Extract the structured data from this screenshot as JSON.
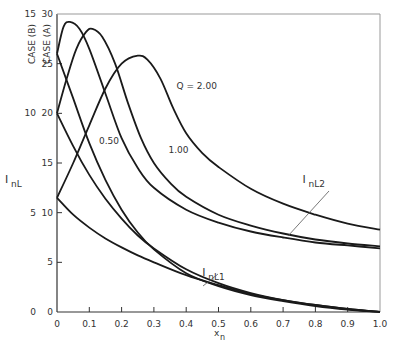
{
  "chart_data": {
    "type": "line",
    "title": "",
    "xlabel": "x_n",
    "ylabel": "I_nL",
    "xlim": [
      0,
      1.0
    ],
    "ylim": [
      0,
      30
    ],
    "grid": false,
    "x_ticks": [
      "0",
      "0.1",
      "0.2",
      "0.3",
      "0.4",
      "0.5",
      "0.6",
      "0.7",
      "0.8",
      "0.9",
      "1.0"
    ],
    "y_axes": [
      {
        "name": "CASE (B)",
        "ticks": [
          "0",
          "5",
          "10",
          "15"
        ],
        "range": [
          0,
          15
        ]
      },
      {
        "name": "CASE (A)",
        "ticks": [
          "0",
          "5",
          "10",
          "15",
          "20",
          "25",
          "30"
        ],
        "range": [
          0,
          30
        ]
      }
    ],
    "curve_labels": [
      {
        "text": "Q = 2.00",
        "x": 0.37,
        "y": 22.4
      },
      {
        "text": "1.00",
        "x": 0.345,
        "y": 16.0
      },
      {
        "text": "0.50",
        "x": 0.13,
        "y": 16.9
      }
    ],
    "group_labels": [
      {
        "main": "I",
        "sub": "nL2",
        "x": 0.76,
        "y": 13.0
      },
      {
        "main": "I",
        "sub": "nL1",
        "x": 0.45,
        "y": 3.6
      }
    ],
    "series": [
      {
        "name": "I_nL2, Q = 0.50",
        "group": "I_nL2",
        "x": [
          0,
          0.02,
          0.04,
          0.07,
          0.1,
          0.15,
          0.2,
          0.25,
          0.3,
          0.4,
          0.5,
          0.6,
          0.7,
          0.8,
          0.9,
          1.0
        ],
        "y": [
          26.0,
          28.7,
          29.2,
          28.5,
          26.5,
          22.0,
          17.5,
          14.5,
          12.5,
          10.3,
          9.0,
          8.1,
          7.5,
          7.0,
          6.7,
          6.4
        ]
      },
      {
        "name": "I_nL2, Q = 1.00",
        "group": "I_nL2",
        "x": [
          0,
          0.03,
          0.06,
          0.09,
          0.11,
          0.14,
          0.18,
          0.22,
          0.26,
          0.3,
          0.35,
          0.4,
          0.5,
          0.6,
          0.7,
          0.8,
          0.9,
          1.0
        ],
        "y": [
          20.0,
          23.5,
          26.5,
          28.2,
          28.5,
          27.7,
          25.0,
          21.0,
          17.5,
          15.0,
          13.0,
          11.6,
          9.8,
          8.7,
          7.9,
          7.3,
          6.9,
          6.6
        ]
      },
      {
        "name": "I_nL2, Q = 2.00",
        "group": "I_nL2",
        "x": [
          0,
          0.05,
          0.1,
          0.15,
          0.2,
          0.25,
          0.28,
          0.32,
          0.36,
          0.4,
          0.45,
          0.5,
          0.6,
          0.7,
          0.8,
          0.9,
          1.0
        ],
        "y": [
          11.5,
          15.0,
          18.8,
          22.5,
          25.0,
          25.8,
          25.4,
          23.5,
          20.5,
          18.0,
          16.0,
          14.6,
          12.4,
          10.9,
          9.8,
          8.9,
          8.3
        ]
      },
      {
        "name": "I_nL1, Q = 0.50",
        "group": "I_nL1",
        "x": [
          0,
          0.05,
          0.1,
          0.15,
          0.2,
          0.25,
          0.3,
          0.4,
          0.5,
          0.6,
          0.7,
          0.8,
          0.9,
          1.0
        ],
        "y": [
          26.0,
          21.5,
          17.0,
          13.3,
          10.3,
          8.0,
          6.3,
          3.9,
          2.6,
          1.7,
          1.1,
          0.6,
          0.25,
          0
        ]
      },
      {
        "name": "I_nL1, Q = 1.00",
        "group": "I_nL1",
        "x": [
          0,
          0.05,
          0.1,
          0.15,
          0.2,
          0.25,
          0.3,
          0.4,
          0.5,
          0.6,
          0.7,
          0.8,
          0.9,
          1.0
        ],
        "y": [
          20.0,
          16.7,
          13.8,
          11.4,
          9.4,
          7.7,
          6.4,
          4.3,
          2.9,
          1.9,
          1.2,
          0.7,
          0.3,
          0
        ]
      },
      {
        "name": "I_nL1, Q = 2.00",
        "group": "I_nL1",
        "x": [
          0,
          0.05,
          0.1,
          0.15,
          0.2,
          0.25,
          0.3,
          0.4,
          0.5,
          0.6,
          0.7,
          0.8,
          0.9,
          1.0
        ],
        "y": [
          11.5,
          9.8,
          8.5,
          7.4,
          6.5,
          5.7,
          5.0,
          3.7,
          2.7,
          1.8,
          1.2,
          0.7,
          0.3,
          0
        ]
      }
    ]
  }
}
